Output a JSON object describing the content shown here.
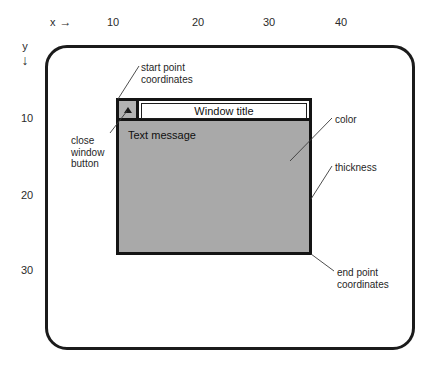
{
  "figure": {
    "background_color": "#ffffff",
    "line_color": "#1b1b1b",
    "window_fill_color": "#a9a9a9",
    "titlebar_fill_color": "#ffffff",
    "close_button_fill_color": "#b3b3b3"
  },
  "axes": {
    "x": {
      "label": "x",
      "arrow": "→",
      "ticks": [
        "10",
        "20",
        "30",
        "40"
      ]
    },
    "y": {
      "label": "y",
      "arrow": "↓",
      "ticks": [
        "10",
        "20",
        "30"
      ]
    }
  },
  "window": {
    "title": "Window title",
    "message": "Text message",
    "close_button_icon": "triangle-up"
  },
  "callouts": {
    "start_point": "start point\ncoordinates",
    "close_button": "close\nwindow\nbutton",
    "color": "color",
    "thickness": "thickness",
    "end_point": "end point\ncoordinates"
  }
}
